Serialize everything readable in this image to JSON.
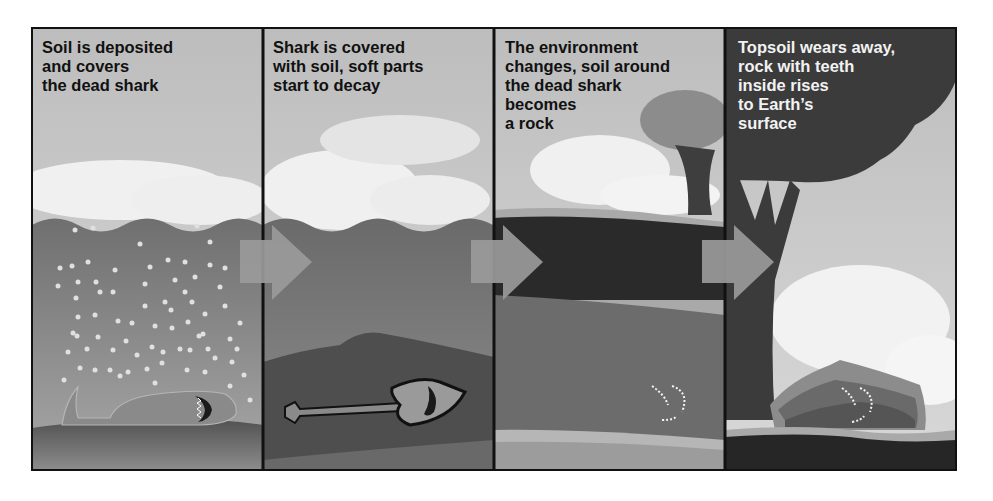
{
  "diagram": {
    "panels": [
      {
        "id": "panel-1",
        "caption": "Soil is deposited\nand covers\nthe dead shark",
        "scene": "dead shark lying on sea floor, sediment particles falling through water"
      },
      {
        "id": "panel-2",
        "caption": "Shark is covered\nwith soil, soft parts\nstart to decay",
        "scene": "shark skeleton buried in soil layer"
      },
      {
        "id": "panel-3",
        "caption": "The environment\nchanges, soil around\nthe dead shark\nbecomes\na rock",
        "scene": "layers of rock with shark teeth embedded, tree on land above"
      },
      {
        "id": "panel-4",
        "caption": "Topsoil wears away,\nrock with teeth\ninside rises\nto Earth’s\nsurface",
        "scene": "rock containing teeth exposed at surface beneath a tree"
      }
    ],
    "arrows": 3,
    "colors": {
      "sky": "#c9c9c9",
      "cloud": "#f2f2f2",
      "water": "#8a8a8a",
      "soil": "#5e5e5e",
      "rock_dark": "#262626",
      "sand": "#b3b3b3",
      "arrow": "#9a9a9a",
      "frame": "#111111",
      "text_dark": "#111111",
      "text_light": "#f2f2f2"
    }
  }
}
